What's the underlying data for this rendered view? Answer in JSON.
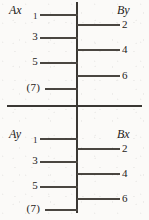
{
  "figure": {
    "type": "ladder-tick-diagram",
    "background_color": "#fbfaf8",
    "ink_color": "#3a3733",
    "panels": [
      {
        "id": "top",
        "caption_left": "Ax",
        "caption_right": "By",
        "left_labels": [
          "1",
          "3",
          "5",
          "(7)"
        ],
        "right_labels": [
          "2",
          "4",
          "6"
        ]
      },
      {
        "id": "bottom",
        "caption_left": "Ay",
        "caption_right": "Bx",
        "left_labels": [
          "1",
          "3",
          "5",
          "(7)"
        ],
        "right_labels": [
          "2",
          "4",
          "6"
        ]
      }
    ]
  }
}
